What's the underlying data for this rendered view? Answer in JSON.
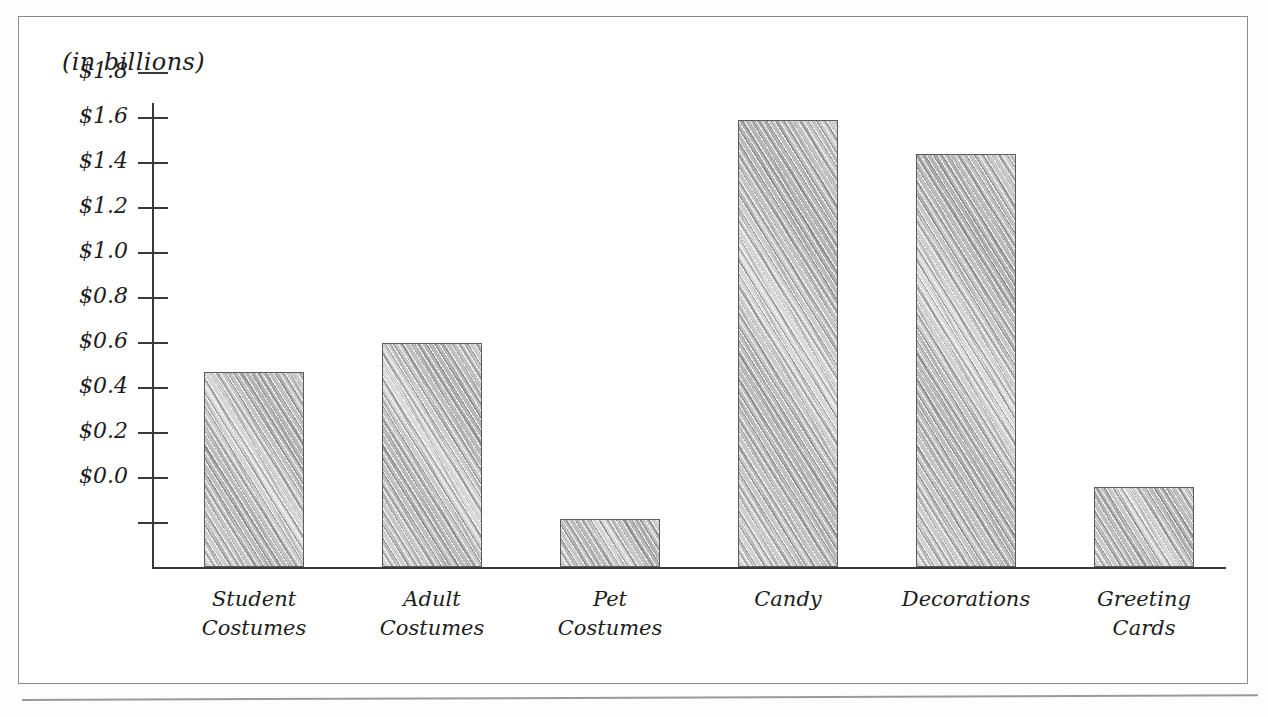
{
  "figure": {
    "axis_note": "(in billions)"
  },
  "chart_data": {
    "type": "bar",
    "title": "",
    "subtitle": "",
    "xlabel": "",
    "ylabel": "(in billions)",
    "categories": [
      "Student\nCostumes",
      "Adult\nCostumes",
      "Pet\nCostumes",
      "Candy",
      "Decorations",
      "Greeting\nCards"
    ],
    "values": [
      0.47,
      0.6,
      -0.18,
      1.59,
      1.44,
      -0.04
    ],
    "value_labels": [
      "$0.47",
      "$0.60",
      "-$0.18",
      "$1.59",
      "$1.44",
      "-$0.04"
    ],
    "ytick_labels": [
      "$1.8",
      "$1.6",
      "$1.4",
      "$1.2",
      "$1.0",
      "$0.8",
      "$0.6",
      "$0.4",
      "$0.2",
      "$0.0"
    ],
    "ytick_values": [
      1.8,
      1.6,
      1.4,
      1.2,
      1.0,
      0.8,
      0.6,
      0.4,
      0.2,
      0.0
    ],
    "ylim": [
      -0.36,
      1.8
    ],
    "grid": false,
    "legend": null,
    "colors": {
      "bar_fill": "#c9c9c9",
      "bar_edge": "#5c5c5c",
      "axis": "#3a3a3a",
      "text": "#1d1d1d",
      "frame": "#8a8a8a",
      "background": "#ffffff"
    }
  }
}
